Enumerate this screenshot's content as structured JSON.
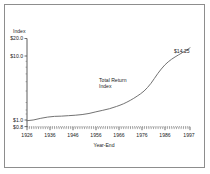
{
  "figure": {
    "frame_color": "#8d8d8d",
    "background": "#ffffff"
  },
  "chart_data": {
    "type": "line",
    "title": "",
    "xlabel": "Year-End",
    "ylabel": "Index",
    "yscale": "log",
    "ylim": [
      0.8,
      20.0
    ],
    "xlim": [
      1926,
      1997
    ],
    "grid": false,
    "legend": "none",
    "y_tick_labels": [
      "$20.0",
      "$10.0",
      "$1.0",
      "$0.8"
    ],
    "y_tick_values": [
      20.0,
      10.0,
      1.0,
      0.8
    ],
    "x_tick_labels": [
      "1926",
      "1936",
      "1946",
      "1956",
      "1966",
      "1976",
      "1986",
      "1997"
    ],
    "x_tick_values": [
      1926,
      1936,
      1946,
      1956,
      1966,
      1976,
      1986,
      1997
    ],
    "series": [
      {
        "name": "Total Return Index",
        "color": "#6a6a6a",
        "x": [
          1926,
          1929,
          1932,
          1935,
          1938,
          1941,
          1944,
          1947,
          1950,
          1953,
          1956,
          1959,
          1962,
          1965,
          1968,
          1971,
          1974,
          1977,
          1980,
          1983,
          1986,
          1989,
          1992,
          1995,
          1997
        ],
        "y": [
          1.0,
          1.03,
          1.09,
          1.14,
          1.17,
          1.18,
          1.2,
          1.22,
          1.25,
          1.3,
          1.38,
          1.46,
          1.55,
          1.68,
          1.85,
          2.1,
          2.45,
          2.95,
          3.9,
          5.6,
          7.6,
          9.4,
          11.0,
          12.8,
          14.25
        ]
      }
    ],
    "annotations": [
      {
        "name": "series-annotation",
        "line1": "Total Return",
        "line2": "Index",
        "x": 1962,
        "y": 3.4
      },
      {
        "name": "endpoint-value-label",
        "text": "$14.25",
        "x": 1997,
        "y": 14.25
      }
    ]
  }
}
